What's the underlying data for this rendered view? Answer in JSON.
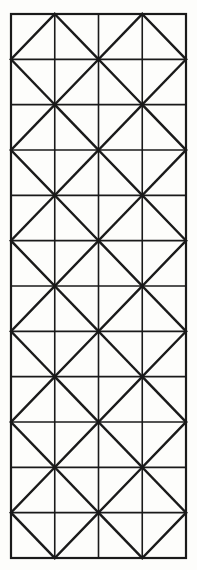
{
  "figure": {
    "name": "diagonal-grid-pattern",
    "canvas": {
      "width": 197,
      "height": 570,
      "background_color": "#fdfdfb"
    },
    "geometry": {
      "origin_x": 11,
      "origin_y": 14,
      "grid_width": 175,
      "grid_height": 544,
      "columns": 4,
      "rows": 12,
      "cell_width": 43.75,
      "cell_height": 45.333
    },
    "style": {
      "line_color": "#1a1a1a",
      "border_color": "#1a1a1a",
      "border_width": 2.2,
      "grid_line_width": 1.6,
      "diagonal_line_width": 2.4,
      "line_cap": "square"
    },
    "pattern": {
      "type": "checkerboard-diagonals",
      "rule": "cell (r,c) draws a forward slash when (r + c) is even, a back slash when (r + c) is odd",
      "forward_slash_label": "/",
      "back_slash_label": "\\"
    }
  }
}
